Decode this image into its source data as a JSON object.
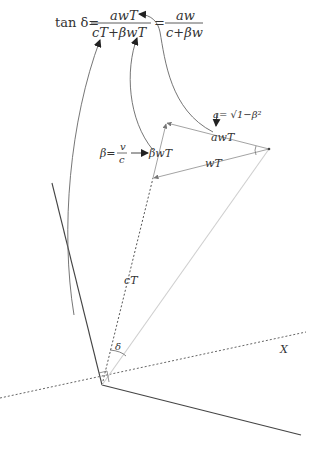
{
  "formula": {
    "lhs": "tan δ=",
    "frac1_num": "awT",
    "frac1_den": "cT+βwT",
    "equals": "=",
    "frac2_num": "aw",
    "frac2_den": "c+βw"
  },
  "labels": {
    "a_def": "a= √1−β²",
    "beta_def_lhs": "β=",
    "beta_def_num": "v",
    "beta_def_den": "c",
    "beta_wT": "βwT",
    "awT": "awT",
    "wT": "wT",
    "cT": "cT",
    "delta": "δ",
    "x_axis": "X"
  },
  "colors": {
    "dark_line": "#444444",
    "grey_line": "#888888",
    "light_line": "#c8c8c8",
    "text": "#333333"
  }
}
